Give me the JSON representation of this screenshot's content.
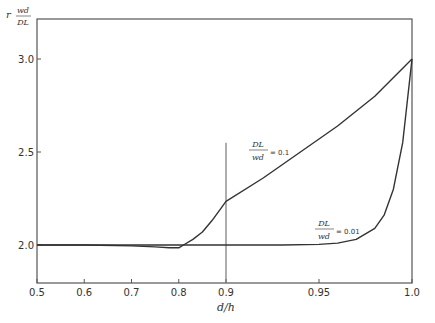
{
  "chart_data": {
    "type": "line",
    "title": "",
    "xlabel": "d/h",
    "ylabel": {
      "prefix": "r",
      "num": "wd",
      "den": "D_L"
    },
    "x_scale": "piecewise (0.5–0.9 linear, 0.9–1.0 expanded)",
    "xlim": [
      0.5,
      1.0
    ],
    "ylim": [
      1.8,
      3.15
    ],
    "x_ticks": [
      {
        "value": 0.5,
        "label": "0.5"
      },
      {
        "value": 0.6,
        "label": "0.6"
      },
      {
        "value": 0.7,
        "label": "0.7"
      },
      {
        "value": 0.8,
        "label": "0.8"
      },
      {
        "value": 0.9,
        "label": "0.9"
      },
      {
        "value": 0.95,
        "label": "0.95"
      },
      {
        "value": 1.0,
        "label": "1.0"
      }
    ],
    "y_ticks": [
      {
        "value": 2.0,
        "label": "2.0"
      },
      {
        "value": 2.5,
        "label": "2.5"
      },
      {
        "value": 3.0,
        "label": "3.0"
      }
    ],
    "reference_line": {
      "x": 0.9,
      "y_from": 1.8,
      "y_to": 2.55
    },
    "series": [
      {
        "name": "DL/wd = 0.1",
        "label_num": "D_L",
        "label_den": "wd",
        "label_value": "= 0.1",
        "x": [
          0.5,
          0.6,
          0.7,
          0.75,
          0.78,
          0.8,
          0.81,
          0.83,
          0.85,
          0.87,
          0.89,
          0.9,
          0.92,
          0.94,
          0.96,
          0.98,
          1.0
        ],
        "y": [
          2.0,
          2.0,
          1.995,
          1.99,
          1.985,
          1.985,
          2.0,
          2.03,
          2.07,
          2.13,
          2.2,
          2.235,
          2.36,
          2.5,
          2.64,
          2.8,
          3.0
        ]
      },
      {
        "name": "DL/wd = 0.01",
        "label_num": "D_L",
        "label_den": "wd",
        "label_value": "= 0.01",
        "x": [
          0.5,
          0.6,
          0.7,
          0.8,
          0.9,
          0.93,
          0.95,
          0.96,
          0.97,
          0.98,
          0.985,
          0.99,
          0.995,
          1.0
        ],
        "y": [
          2.0,
          2.0,
          2.0,
          2.0,
          2.0,
          2.0,
          2.003,
          2.01,
          2.03,
          2.09,
          2.16,
          2.3,
          2.55,
          3.0
        ]
      }
    ]
  }
}
